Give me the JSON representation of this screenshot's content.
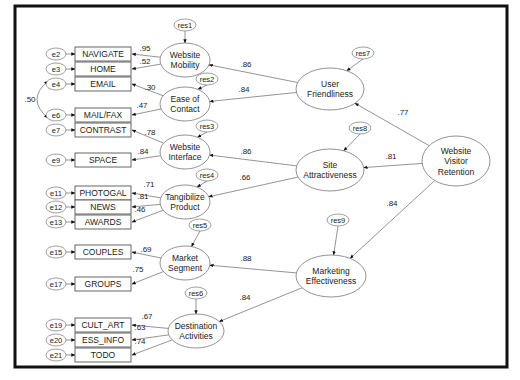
{
  "observed": [
    {
      "id": "NAVIGATE",
      "label": "NAVIGATE",
      "error": "e2"
    },
    {
      "id": "HOME",
      "label": "HOME",
      "error": "e3"
    },
    {
      "id": "EMAIL",
      "label": "EMAIL",
      "error": "e4"
    },
    {
      "id": "MAILFAX",
      "label": "MAIL/FAX",
      "error": "e6"
    },
    {
      "id": "CONTRAST",
      "label": "CONTRAST",
      "error": "e7"
    },
    {
      "id": "SPACE",
      "label": "SPACE",
      "error": "e9"
    },
    {
      "id": "PHOTOGAL",
      "label": "PHOTOGAL",
      "error": "e11"
    },
    {
      "id": "NEWS",
      "label": "NEWS",
      "error": "e12"
    },
    {
      "id": "AWARDS",
      "label": "AWARDS",
      "error": "e13"
    },
    {
      "id": "COUPLES",
      "label": "COUPLES",
      "error": "e15"
    },
    {
      "id": "GROUPS",
      "label": "GROUPS",
      "error": "e17"
    },
    {
      "id": "CULT_ART",
      "label": "CULT_ART",
      "error": "e19"
    },
    {
      "id": "ESS_INFO",
      "label": "ESS_INFO",
      "error": "e20"
    },
    {
      "id": "TODO",
      "label": "TODO",
      "error": "e21"
    }
  ],
  "latent": [
    {
      "id": "WM",
      "lines": [
        "Website",
        "Mobility"
      ],
      "residual": "res1"
    },
    {
      "id": "EC",
      "lines": [
        "Ease of",
        "Contact"
      ],
      "residual": "res2"
    },
    {
      "id": "WI",
      "lines": [
        "Website",
        "Interface"
      ],
      "residual": "res3"
    },
    {
      "id": "TP",
      "lines": [
        "Tangibilize",
        "Product"
      ],
      "residual": "res4"
    },
    {
      "id": "MS",
      "lines": [
        "Market",
        "Segment"
      ],
      "residual": "res5"
    },
    {
      "id": "DA",
      "lines": [
        "Destination",
        "Activities"
      ],
      "residual": "res6"
    },
    {
      "id": "UF",
      "lines": [
        "User",
        "Friendliness"
      ],
      "residual": "res7"
    },
    {
      "id": "SA",
      "lines": [
        "Site",
        "Attractiveness"
      ],
      "residual": "res8"
    },
    {
      "id": "ME",
      "lines": [
        "Marketing",
        "Effectiveness"
      ],
      "residual": "res9"
    },
    {
      "id": "WVR",
      "lines": [
        "Website",
        "Visitor",
        "Retention"
      ],
      "residual": ""
    }
  ],
  "loadings": [
    {
      "from": "WM",
      "to": "NAVIGATE",
      "value": ".95"
    },
    {
      "from": "WM",
      "to": "HOME",
      "value": ".52"
    },
    {
      "from": "EC",
      "to": "EMAIL",
      "value": ".30"
    },
    {
      "from": "EC",
      "to": "MAILFAX",
      "value": ".47"
    },
    {
      "from": "WI",
      "to": "CONTRAST",
      "value": ".78"
    },
    {
      "from": "WI",
      "to": "SPACE",
      "value": ".84"
    },
    {
      "from": "TP",
      "to": "PHOTOGAL",
      "value": ".71"
    },
    {
      "from": "TP",
      "to": "NEWS",
      "value": ".81"
    },
    {
      "from": "TP",
      "to": "AWARDS",
      "value": ".46"
    },
    {
      "from": "MS",
      "to": "COUPLES",
      "value": ".69"
    },
    {
      "from": "MS",
      "to": "GROUPS",
      "value": ".75"
    },
    {
      "from": "DA",
      "to": "CULT_ART",
      "value": ".67"
    },
    {
      "from": "DA",
      "to": "ESS_INFO",
      "value": ".63"
    },
    {
      "from": "DA",
      "to": "TODO",
      "value": ".74"
    }
  ],
  "structural": [
    {
      "from": "UF",
      "to": "WM",
      "value": ".86"
    },
    {
      "from": "UF",
      "to": "EC",
      "value": ".84"
    },
    {
      "from": "SA",
      "to": "WI",
      "value": ".86"
    },
    {
      "from": "SA",
      "to": "TP",
      "value": ".66"
    },
    {
      "from": "ME",
      "to": "MS",
      "value": ".88"
    },
    {
      "from": "ME",
      "to": "DA",
      "value": ".84"
    },
    {
      "from": "WVR",
      "to": "UF",
      "value": ".77"
    },
    {
      "from": "WVR",
      "to": "SA",
      "value": ".81"
    },
    {
      "from": "WVR",
      "to": "ME",
      "value": ".84"
    }
  ],
  "covariances": [
    {
      "between": [
        "e4",
        "e6"
      ],
      "value": ".50"
    }
  ]
}
